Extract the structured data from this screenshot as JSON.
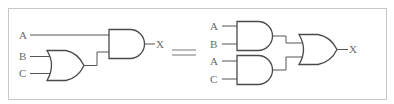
{
  "figure": {
    "type": "logic-circuit-equivalence",
    "left_circuit": {
      "inputs": [
        "A",
        "B",
        "C"
      ],
      "output": "X",
      "gates": [
        {
          "id": "or1",
          "type": "OR",
          "inputs": [
            "B",
            "C"
          ]
        },
        {
          "id": "and1",
          "type": "AND",
          "inputs": [
            "A",
            "or1"
          ]
        }
      ]
    },
    "relation": "=",
    "right_circuit": {
      "inputs": [
        "A",
        "B",
        "A",
        "C"
      ],
      "output": "X",
      "gates": [
        {
          "id": "and_top",
          "type": "AND",
          "inputs": [
            "A",
            "B"
          ]
        },
        {
          "id": "and_bottom",
          "type": "AND",
          "inputs": [
            "A",
            "C"
          ]
        },
        {
          "id": "or_out",
          "type": "OR",
          "inputs": [
            "and_top",
            "and_bottom"
          ]
        }
      ]
    },
    "labels": {
      "left_a": "A",
      "left_b": "B",
      "left_c": "C",
      "left_x": "X",
      "right_a1": "A",
      "right_b": "B",
      "right_a2": "A",
      "right_c": "C",
      "right_x": "X"
    },
    "colors": {
      "frame": "#c8c8c8",
      "stroke": "#4a4a4a",
      "label": "#6a6a6a"
    }
  }
}
